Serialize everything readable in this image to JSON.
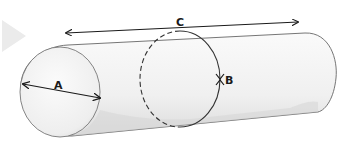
{
  "diagram": {
    "labels": {
      "a": "A",
      "b": "B",
      "c": "C"
    },
    "dimensions": [
      {
        "label": "A",
        "meaning": "diameter of end face"
      },
      {
        "label": "B",
        "meaning": "circumference around cylinder"
      },
      {
        "label": "C",
        "meaning": "length of cylinder"
      }
    ],
    "colors": {
      "outline": "#555555",
      "arrow": "#1a1a1a",
      "shade": "#d8d8d8",
      "fill": "#f3f3f3",
      "chevron": "#e6e6e6"
    }
  }
}
